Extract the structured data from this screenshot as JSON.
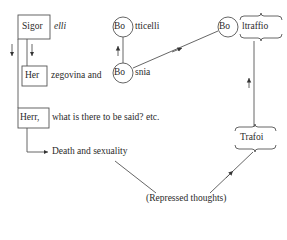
{
  "diagram": {
    "left": {
      "sigor": {
        "boxed": "Sigor",
        "rest": "elli"
      },
      "her": {
        "boxed": "Her",
        "rest": "zegovina and"
      },
      "herr": {
        "boxed": "Herr,",
        "rest": "what is there to be said? etc."
      },
      "death": "Death and sexuality"
    },
    "middle": {
      "bo1": {
        "circled": "Bo",
        "rest": "tticelli"
      },
      "bo2": {
        "circled": "Bo",
        "rest": "snia"
      }
    },
    "right": {
      "bo3": {
        "circled": "Bo",
        "rest": "ltraffio"
      },
      "trafoi": "Trafoi"
    },
    "bottom": "(Repressed thoughts)"
  },
  "colors": {
    "line": "#555555",
    "text": "#2a2a2a",
    "background": "#ffffff"
  }
}
